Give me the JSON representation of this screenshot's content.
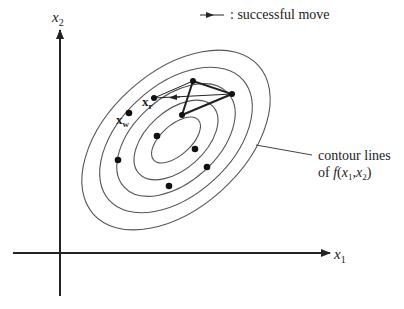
{
  "axes": {
    "x_label": "x",
    "x_sub": "1",
    "y_label": "x",
    "y_sub": "2"
  },
  "legend": {
    "text": ": successful move"
  },
  "annotation": {
    "line1": "contour lines",
    "line2_prefix": "of ",
    "line2_func": "f",
    "line2_args_open": "(",
    "line2_x1": "x",
    "line2_x1_sub": "1",
    "line2_comma": ",",
    "line2_x2": "x",
    "line2_x2_sub": "2",
    "line2_args_close": ")"
  },
  "points": {
    "xw_label": "x",
    "xw_sub": "w",
    "xr_label": "x",
    "xr_sub": "r"
  },
  "colors": {
    "ink": "#222222",
    "contour": "#555555"
  }
}
